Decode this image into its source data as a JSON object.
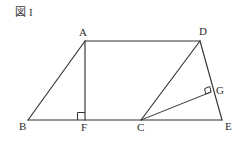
{
  "figure": {
    "caption_glyph": "図",
    "caption_number": "I",
    "background_color": "#ffffff",
    "stroke_color": "#333333"
  },
  "diagram": {
    "type": "plane-geometry",
    "canvas": {
      "width": 245,
      "height": 147
    },
    "points": {
      "A": {
        "label": "A",
        "x": 85,
        "y": 41,
        "label_x": 79,
        "label_y": 27
      },
      "B": {
        "label": "B",
        "x": 28,
        "y": 120,
        "label_x": 19,
        "label_y": 121
      },
      "C": {
        "label": "C",
        "x": 141,
        "y": 120,
        "label_x": 137,
        "label_y": 122
      },
      "D": {
        "label": "D",
        "x": 200,
        "y": 41,
        "label_x": 199,
        "label_y": 26
      },
      "E": {
        "label": "E",
        "x": 222,
        "y": 120,
        "label_x": 225,
        "label_y": 121
      },
      "F": {
        "label": "F",
        "x": 85,
        "y": 120,
        "label_x": 81,
        "label_y": 122
      },
      "G": {
        "label": "G",
        "x": 211,
        "y": 92,
        "label_x": 216,
        "label_y": 85
      }
    },
    "segments": [
      {
        "name": "AD",
        "from": "A",
        "to": "D"
      },
      {
        "name": "AB",
        "from": "A",
        "to": "B"
      },
      {
        "name": "AF",
        "from": "A",
        "to": "F"
      },
      {
        "name": "BE",
        "from": "B",
        "to": "E"
      },
      {
        "name": "DE",
        "from": "D",
        "to": "E"
      },
      {
        "name": "DC",
        "from": "D",
        "to": "C"
      },
      {
        "name": "CG",
        "from": "C",
        "to": "G"
      }
    ],
    "right_angles": [
      {
        "name": "angle-AFB",
        "at": "F",
        "between": [
          "AF",
          "FB"
        ]
      },
      {
        "name": "angle-CGD",
        "at": "G",
        "between": [
          "CG",
          "GD"
        ]
      }
    ]
  }
}
